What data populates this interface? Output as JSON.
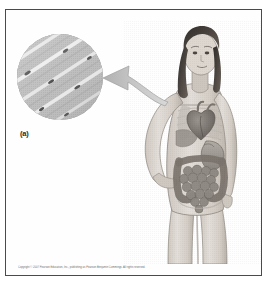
{
  "figure": {
    "background_color": "#ffffff",
    "frame_color": "#4a4a4a",
    "style": "grayscale halftone textbook illustration"
  },
  "panel_label": {
    "text": "(a)",
    "color": "#2b2b2b"
  },
  "inset": {
    "name": "histology-micrograph-inset",
    "shape": "circle",
    "subject": "striated muscle tissue fibers",
    "description": "Light micrograph of tissue showing diagonal striated fibers",
    "base_color": "#b9b9b9",
    "fiber_highlight_color": "#ececec",
    "nucleus_color": "#4f4f4f",
    "fiber_count": 5,
    "fiber_angle_degrees": -33
  },
  "arrow": {
    "name": "magnification-callout-arrow",
    "direction": "right-to-left",
    "points_from": "chest / heart region of figure",
    "points_to": "circular tissue inset",
    "color": "#bdbdbd",
    "outline_color": "#9e9e9e"
  },
  "human_figure": {
    "name": "anatomical-female-figure",
    "subject": "standing young woman, anterior view, left hand on hip",
    "hair": "long dark hair",
    "skin_color": "#d9d2cc",
    "outline_color": "#8e8880",
    "organs_visible": [
      "heart",
      "lungs",
      "liver",
      "stomach",
      "small intestine",
      "large intestine",
      "ribs",
      "pelvis"
    ],
    "organ_color": "#a6a09a",
    "organ_shadow_color": "#6e6862"
  },
  "copyright": {
    "text": "Copyright © 2007 Pearson Education, Inc., publishing as Pearson Benjamin Cummings. All rights reserved.",
    "color": "#6d6d6d"
  }
}
